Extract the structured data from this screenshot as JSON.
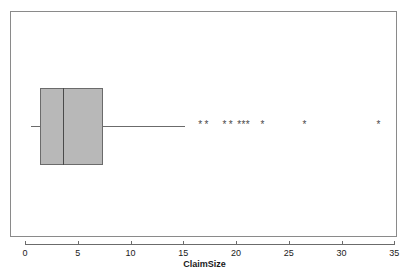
{
  "chart_data": {
    "type": "box",
    "title": "",
    "xlabel": "ClaimSize",
    "ylabel": "",
    "orientation": "horizontal",
    "xlim": [
      -0.6,
      35.9
    ],
    "grid": false,
    "legend": null,
    "xticks": [
      0,
      5,
      10,
      15,
      20,
      25,
      30,
      35
    ],
    "xticklabels": [
      "0",
      "5",
      "10",
      "15",
      "20",
      "25",
      "30",
      "35"
    ],
    "box": {
      "whisker_low": 0.6,
      "q1": 1.4,
      "median": 3.6,
      "q3": 7.4,
      "whisker_high": 15.2,
      "fill_color": "#b8b8b8",
      "edge_color": "#6b6b6b"
    },
    "outliers": [
      16.6,
      17.2,
      18.9,
      19.5,
      20.3,
      20.7,
      21.1,
      22.5,
      26.5,
      33.5
    ],
    "outlier_marker": "asterisk",
    "outlier_glyph": "*"
  },
  "frame": {
    "border_color": "#8a8a8a",
    "background": "#ffffff"
  }
}
